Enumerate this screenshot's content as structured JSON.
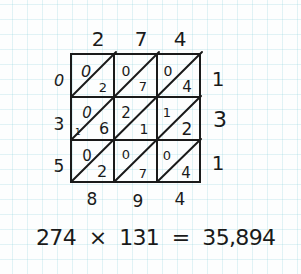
{
  "multiplicand": {
    "digits": [
      "2",
      "7",
      "4"
    ]
  },
  "multiplier": {
    "digits": [
      "1",
      "3",
      "1"
    ]
  },
  "cells": [
    [
      {
        "tens": "0",
        "ones": "2"
      },
      {
        "tens": "0",
        "ones": "7"
      },
      {
        "tens": "0",
        "ones": "4"
      }
    ],
    [
      {
        "tens": "0",
        "ones": "6"
      },
      {
        "tens": "2",
        "ones": "1"
      },
      {
        "tens": "1",
        "ones": "2"
      }
    ],
    [
      {
        "tens": "0",
        "ones": "2"
      },
      {
        "tens": "0",
        "ones": "7"
      },
      {
        "tens": "0",
        "ones": "4"
      }
    ]
  ],
  "carry": "1",
  "left_digits": [
    "0",
    "3",
    "5"
  ],
  "bottom_digits": [
    "8",
    "9",
    "4"
  ],
  "equation": "274  ×  131  =  35,894",
  "colors": {
    "ink": "#1a1a1a",
    "grid": "#cfeef2",
    "paper": "#fdfefe"
  }
}
